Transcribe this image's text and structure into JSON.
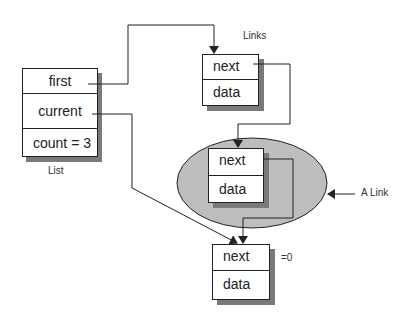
{
  "diagram": {
    "list": {
      "caption": "List",
      "fields": {
        "first": "first",
        "current": "current",
        "count": "count = 3"
      }
    },
    "links_caption": "Links",
    "a_link_caption": "A Link",
    "null_caption": "=0",
    "nodes": [
      {
        "next": "next",
        "data": "data"
      },
      {
        "next": "next",
        "data": "data"
      },
      {
        "next": "next",
        "data": "data"
      }
    ],
    "colors": {
      "line": "#222222",
      "shadow": "#7a7a7a",
      "highlight_ellipse": "#bdbdbd",
      "box_fill": "#ffffff"
    }
  }
}
